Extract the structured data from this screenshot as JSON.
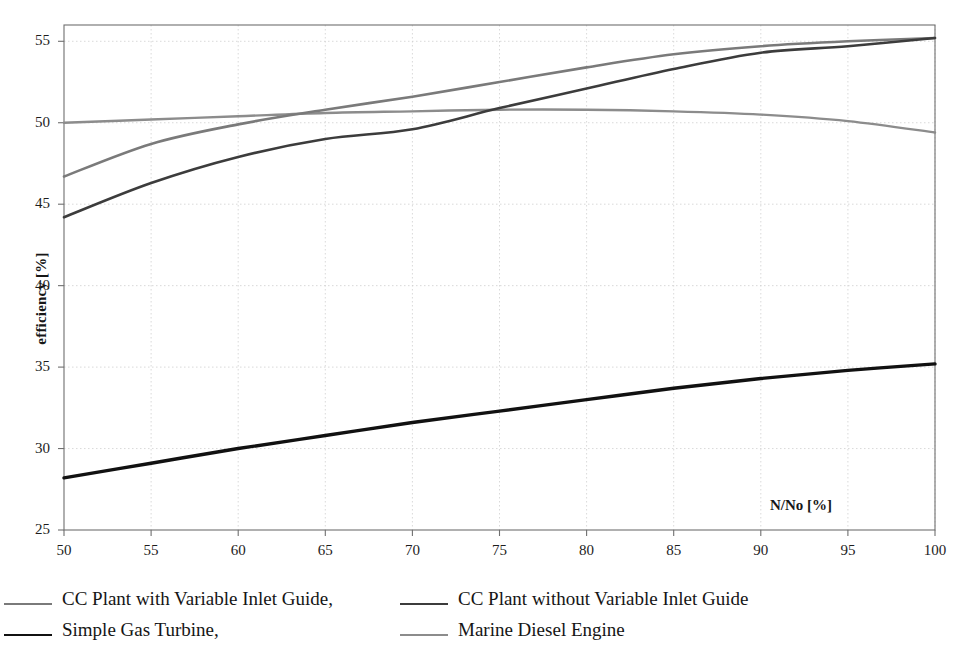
{
  "chart_data": {
    "type": "line",
    "title": "",
    "subtitle": "",
    "xlabel": "N/No  [%]",
    "ylabel": "efficiency  [%]",
    "xlim": [
      50,
      100
    ],
    "ylim": [
      25,
      56
    ],
    "xticks": [
      50,
      55,
      60,
      65,
      70,
      75,
      80,
      85,
      90,
      95,
      100
    ],
    "yticks": [
      25,
      30,
      35,
      40,
      45,
      50,
      55
    ],
    "xtick_labels": [
      "50",
      "55",
      "60",
      "65",
      "70",
      "75",
      "80",
      "85",
      "90",
      "95",
      "100"
    ],
    "ytick_labels": [
      "25",
      "30",
      "35",
      "40",
      "45",
      "50",
      "55"
    ],
    "grid": true,
    "grid_color": "#cfcfcf",
    "axis_color": "#6f6f6f",
    "legend_position": "below-plot",
    "x": [
      50,
      55,
      60,
      65,
      70,
      75,
      80,
      85,
      90,
      95,
      100
    ],
    "series": [
      {
        "name": "CC Plant with Variable Inlet Guide,",
        "color": "#7a7a7a",
        "width": 2.6,
        "values": [
          46.7,
          48.7,
          49.9,
          50.8,
          51.6,
          52.5,
          53.4,
          54.2,
          54.7,
          55.0,
          55.2
        ]
      },
      {
        "name": "CC Plant without Variable Inlet Guide",
        "color": "#3c3c3c",
        "width": 2.6,
        "values": [
          44.2,
          46.3,
          47.9,
          49.0,
          49.6,
          50.9,
          52.1,
          53.3,
          54.3,
          54.7,
          55.2
        ]
      },
      {
        "name": "Simple Gas Turbine,",
        "color": "#111111",
        "width": 3.4,
        "values": [
          28.2,
          29.1,
          30.0,
          30.8,
          31.6,
          32.3,
          33.0,
          33.7,
          34.3,
          34.8,
          35.2
        ]
      },
      {
        "name": "Marine Diesel Engine",
        "color": "#8c8c8c",
        "width": 2.4,
        "values": [
          50.0,
          50.2,
          50.4,
          50.6,
          50.7,
          50.8,
          50.8,
          50.7,
          50.5,
          50.1,
          49.4
        ]
      }
    ]
  },
  "legend": {
    "rows": [
      [
        {
          "label": "CC Plant with Variable Inlet Guide,",
          "color": "#7a7a7a"
        },
        {
          "label": "CC Plant without Variable Inlet Guide",
          "color": "#3c3c3c"
        }
      ],
      [
        {
          "label": "Simple Gas Turbine,",
          "color": "#111111"
        },
        {
          "label": "Marine Diesel Engine",
          "color": "#8c8c8c"
        }
      ]
    ]
  },
  "axes": {
    "x_title": "N/No  [%]",
    "y_title": "efficiency  [%]"
  }
}
